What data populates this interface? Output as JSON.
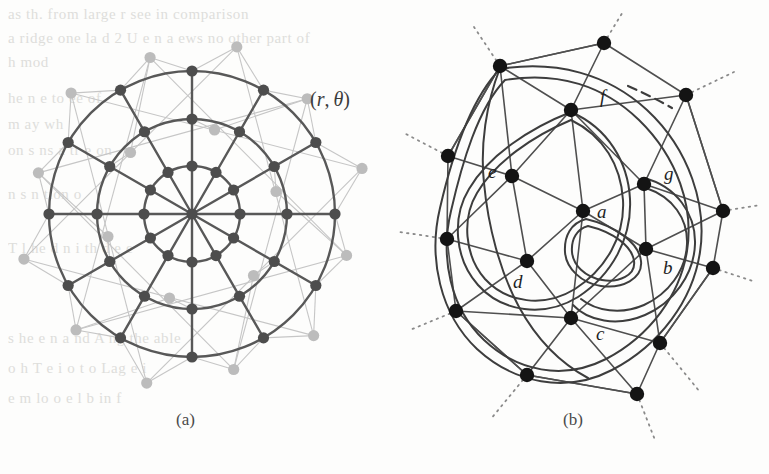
{
  "page": {
    "width": 769,
    "height": 474,
    "background": "#fdfdfc",
    "bleed_through_lines": [
      "as th. from large r  see in comparison",
      "a ridge one  la d 2 U e  n  a  ews  no  other part of",
      "h  mod",
      "he n  e   to   ee  of",
      "m  ay     wh",
      "on   s   ns  a tr  e  on",
      "n   s   n     tion      o",
      "T  l  he d    n   i  th   d   e  e",
      "s   he  e  n   a    nd   A     ng  the  able",
      "o  h  T      e   i  o   t   o   Lag  e  i",
      "e  m     lo  o  e   l      b     in  f"
    ]
  },
  "figures": [
    {
      "id": "a",
      "caption": "(a)",
      "name": "polar-grid-figure",
      "annotation": "(r, θ)",
      "annotation_parts": {
        "open": "(",
        "r": "r",
        "comma": ", ",
        "theta": "θ",
        "close": ")"
      },
      "description": "polar coordinate grid graph overlaid with a lighter perturbed graph",
      "center": {
        "x": 192,
        "y": 214
      },
      "spokes": 12,
      "rings": 3,
      "ring_radii": [
        48,
        95,
        143
      ],
      "colors": {
        "dark_node": "#4d4d4d",
        "dark_edge": "#555555",
        "light_node": "#b9b9b9",
        "light_edge": "#c4c4c4"
      }
    },
    {
      "id": "b",
      "caption": "(b)",
      "name": "planar-graph-figure",
      "description": "planar triangulated graph with curved separating cycles and dotted external edges",
      "vertex_labels": [
        "a",
        "b",
        "c",
        "d",
        "e",
        "f",
        "g"
      ],
      "colors": {
        "node": "#151515",
        "edge": "#4a4a4a",
        "thick_curve": "#3a3a3a",
        "dotted": "#777777"
      }
    }
  ],
  "chart_data": {
    "type": "diagram",
    "title": "",
    "panels": [
      {
        "label": "(a)",
        "kind": "polar-grid-graph",
        "annotation": "(r, θ)",
        "spokes": 12,
        "rings": 3,
        "ring_radii": [
          48,
          95,
          143
        ],
        "node_count_dark": 37,
        "node_count_light": 17,
        "center": [
          192,
          214
        ]
      },
      {
        "label": "(b)",
        "kind": "planar-graph",
        "labeled_vertices": [
          {
            "label": "a",
            "x": 588,
            "y": 211
          },
          {
            "label": "b",
            "x": 663,
            "y": 268
          },
          {
            "label": "c",
            "x": 593,
            "y": 319
          },
          {
            "label": "d",
            "x": 511,
            "y": 281
          },
          {
            "label": "e",
            "x": 489,
            "y": 172
          },
          {
            "label": "f",
            "x": 598,
            "y": 100
          },
          {
            "label": "g",
            "x": 660,
            "y": 175
          }
        ],
        "boundary_vertex_count": 9,
        "dotted_ray_count": 9
      }
    ]
  }
}
